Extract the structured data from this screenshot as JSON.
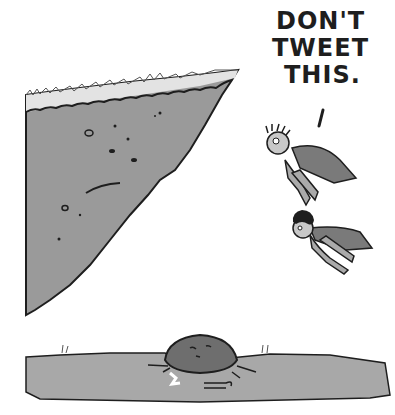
{
  "comic": {
    "speech_lines": [
      "DON'T",
      "TWEET",
      "THIS."
    ],
    "speech_tail": "'",
    "scene": {
      "cliff": "grassy cliff edge on left",
      "heroes": [
        "caped hero with spiky hair and goggles",
        "caped hero with curly hair"
      ],
      "ground": "flat ground with boulder and cane",
      "colors": {
        "fill_gray": "#9a9a9a",
        "ground_gray": "#a8a8a8",
        "boulder": "#6e6e6e",
        "ink": "#1e1e1e",
        "cape": "#7a7a7a",
        "skin": "#c8c8c8",
        "grass_top": "#dedede"
      }
    }
  }
}
